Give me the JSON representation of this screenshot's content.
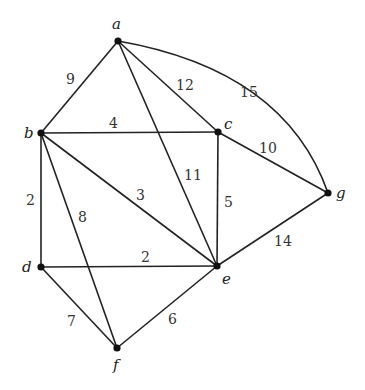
{
  "graph": {
    "type": "weighted undirected graph",
    "nodes": [
      {
        "id": "a",
        "label": "a",
        "x": 118,
        "y": 41,
        "lx": 112,
        "ly": 29
      },
      {
        "id": "b",
        "label": "b",
        "x": 41,
        "y": 133,
        "lx": 24,
        "ly": 138
      },
      {
        "id": "c",
        "label": "c",
        "x": 218,
        "y": 132,
        "lx": 224,
        "ly": 129
      },
      {
        "id": "d",
        "label": "d",
        "x": 41,
        "y": 267,
        "lx": 22,
        "ly": 272
      },
      {
        "id": "e",
        "label": "e",
        "x": 217,
        "y": 266,
        "lx": 222,
        "ly": 284
      },
      {
        "id": "f",
        "label": "f",
        "x": 117,
        "y": 348,
        "lx": 113,
        "ly": 370
      },
      {
        "id": "g",
        "label": "g",
        "x": 328,
        "y": 193,
        "lx": 336,
        "ly": 198
      }
    ],
    "edges": [
      {
        "from": "a",
        "to": "b",
        "weight": "9",
        "wx": 66,
        "wy": 84
      },
      {
        "from": "b",
        "to": "c",
        "weight": "4",
        "wx": 109,
        "wy": 128
      },
      {
        "from": "a",
        "to": "c",
        "weight": "12",
        "wx": 176,
        "wy": 90
      },
      {
        "from": "a",
        "to": "g",
        "weight": "15",
        "wx": 240,
        "wy": 97,
        "curved": true
      },
      {
        "from": "a",
        "to": "e",
        "weight": "11",
        "wx": 184,
        "wy": 180
      },
      {
        "from": "b",
        "to": "e",
        "weight": "3",
        "wx": 136,
        "wy": 200
      },
      {
        "from": "c",
        "to": "g",
        "weight": "10",
        "wx": 259,
        "wy": 153
      },
      {
        "from": "c",
        "to": "e",
        "weight": "5",
        "wx": 224,
        "wy": 207
      },
      {
        "from": "b",
        "to": "d",
        "weight": "2",
        "wx": 26,
        "wy": 205
      },
      {
        "from": "b",
        "to": "f",
        "weight": "8",
        "wx": 78,
        "wy": 222
      },
      {
        "from": "d",
        "to": "e",
        "weight": "2",
        "wx": 141,
        "wy": 262
      },
      {
        "from": "d",
        "to": "f",
        "weight": "7",
        "wx": 67,
        "wy": 326
      },
      {
        "from": "f",
        "to": "e",
        "weight": "6",
        "wx": 168,
        "wy": 324
      },
      {
        "from": "e",
        "to": "g",
        "weight": "14",
        "wx": 274,
        "wy": 246
      }
    ]
  }
}
